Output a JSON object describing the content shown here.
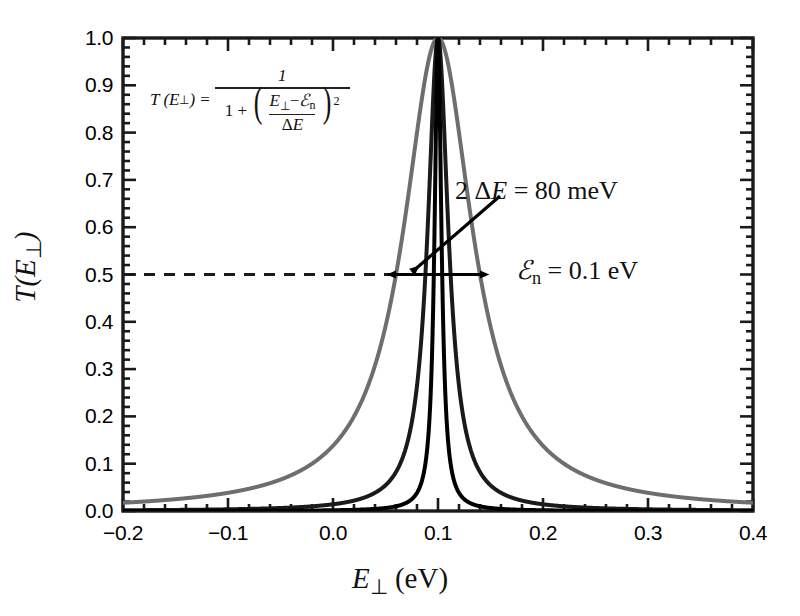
{
  "chart_data": {
    "type": "line",
    "title": "",
    "xlabel": "E⊥ (eV)",
    "ylabel": "T(E⊥)",
    "xlim": [
      -0.2,
      0.4
    ],
    "ylim": [
      0.0,
      1.0
    ],
    "grid": false,
    "legend": "none",
    "xticks": [
      "−0.2",
      "−0.1",
      "0.0",
      "0.1",
      "0.2",
      "0.3",
      "0.4"
    ],
    "xtick_values": [
      -0.2,
      -0.1,
      0.0,
      0.1,
      0.2,
      0.3,
      0.4
    ],
    "yticks": [
      "0.0",
      "0.1",
      "0.2",
      "0.3",
      "0.4",
      "0.5",
      "0.6",
      "0.7",
      "0.8",
      "0.9",
      "1.0"
    ],
    "ytick_values": [
      0.0,
      0.1,
      0.2,
      0.3,
      0.4,
      0.5,
      0.6,
      0.7,
      0.8,
      0.9,
      1.0
    ],
    "minor_ticks_per_interval": 5,
    "formula": "T(E⊥) = 1 / (1 + ((E⊥ − ℰn)/ΔE)²)",
    "resonance_energy_eV": 0.1,
    "half_width_marker": "2 ΔE = 80 meV",
    "series": [
      {
        "name": "broad",
        "delta_E": 0.04,
        "center": 0.1,
        "peak": 1.0,
        "color": "#6e6e6e",
        "width_px": 4.0
      },
      {
        "name": "medium",
        "delta_E": 0.012,
        "center": 0.1,
        "peak": 1.0,
        "color": "#1a1a1a",
        "width_px": 4.0
      },
      {
        "name": "narrow",
        "delta_E": 0.004,
        "center": 0.1,
        "peak": 1.0,
        "color": "#000000",
        "width_px": 4.0
      }
    ],
    "annotations": [
      {
        "name": "half-max-dashed-line",
        "y": 0.5,
        "style": "dashed",
        "from_x": -0.2,
        "to_x": 0.1
      },
      {
        "name": "width-double-arrow",
        "y": 0.5,
        "from_x": 0.06,
        "to_x": 0.14
      },
      {
        "name": "width-label",
        "text": "2 ΔE = 80 meV"
      },
      {
        "name": "resonance-label",
        "text": "ℰn = 0.1 eV"
      }
    ]
  },
  "axes": {
    "x_title_main": "E",
    "x_title_sub": "⊥",
    "x_title_unit": "(eV)",
    "y_title_main": "T(E",
    "y_title_sub": "⊥",
    "y_title_tail": ")"
  },
  "formula": {
    "lhs": "T (E",
    "lhs_sub": "⊥",
    "lhs_close": ")",
    "equals": "=",
    "numerator": "1",
    "den_one_plus": "1 +",
    "inner_num_a": "E",
    "inner_num_sub": "⊥",
    "inner_num_minus": "−",
    "inner_num_e": "ℰ",
    "inner_num_esub": "n",
    "inner_den_delta": "Δ",
    "inner_den_e": "E",
    "exponent": "2"
  },
  "annotations": {
    "width_prefix": "2",
    "width_delta": "Δ",
    "width_e": "E",
    "width_eq": "= 80 meV",
    "level_e": "ℰ",
    "level_sub": "n",
    "level_eq": "= 0.1 eV"
  }
}
